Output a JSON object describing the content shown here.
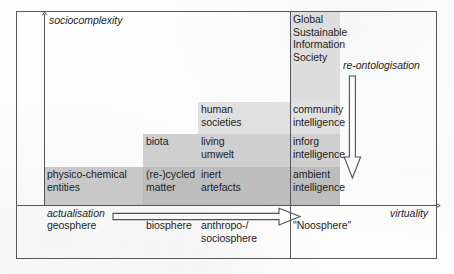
{
  "figure": {
    "axes": {
      "y_label": "sociocomplexity",
      "x_label": "virtuality",
      "origin_label": "actualisation"
    },
    "annotations": {
      "re_ontologisation": "re-ontologisation"
    },
    "top_block": {
      "lines": "Global\nSustainable\nInformation\nSociety"
    },
    "matrix": {
      "rows": [
        {
          "name": "human-societies-row",
          "cells": [
            {
              "name": "col1",
              "text": ""
            },
            {
              "name": "col2",
              "text": ""
            },
            {
              "name": "col3",
              "text": "human\nsocieties"
            },
            {
              "name": "col4",
              "text": "community\nintelligence"
            }
          ]
        },
        {
          "name": "biota-row",
          "cells": [
            {
              "name": "col1",
              "text": ""
            },
            {
              "name": "col2",
              "text": "biota"
            },
            {
              "name": "col3",
              "text": "living\numwelt"
            },
            {
              "name": "col4",
              "text": "inforg\nintelligence"
            }
          ]
        },
        {
          "name": "physico-chemical-row",
          "cells": [
            {
              "name": "col1",
              "text": "physico-chemical\nentities"
            },
            {
              "name": "col2",
              "text": "(re-)cycled\nmatter"
            },
            {
              "name": "col3",
              "text": "inert\nartefacts"
            },
            {
              "name": "col4",
              "text": "ambient\nintelligence"
            }
          ]
        }
      ]
    },
    "baseline": {
      "cells": [
        {
          "name": "geosphere",
          "text": "geosphere"
        },
        {
          "name": "biosphere",
          "text": "biosphere"
        },
        {
          "name": "anthropo-sociosphere",
          "text": "anthropo-/\nsociosphere"
        },
        {
          "name": "noosphere",
          "text": "\"Noosphere\""
        }
      ]
    },
    "colors": {
      "ink": "#1d1d1f",
      "rule": "#53565a",
      "shade_light": "#e3e3e3",
      "shade_mid": "#d2d2d2",
      "shade_dark": "#c0c0c0",
      "background": "#fdfdfd"
    }
  }
}
